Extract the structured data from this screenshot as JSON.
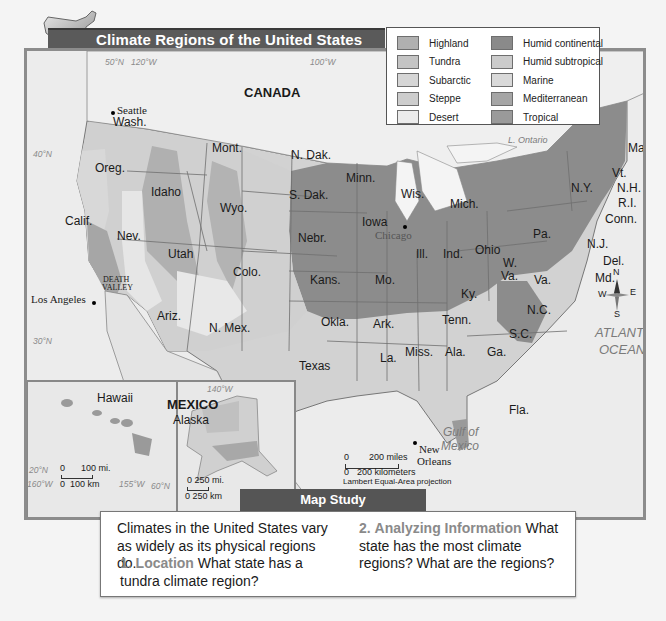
{
  "title": "Climate Regions of the United States",
  "legend": {
    "left": [
      {
        "label": "Highland",
        "color": "#b0b0b0"
      },
      {
        "label": "Tundra",
        "color": "#c4c4c4"
      },
      {
        "label": "Subarctic",
        "color": "#d6d6d6"
      },
      {
        "label": "Steppe",
        "color": "#cdcdcd"
      },
      {
        "label": "Desert",
        "color": "#ececec"
      }
    ],
    "right": [
      {
        "label": "Humid continental",
        "color": "#8a8a8a"
      },
      {
        "label": "Humid subtropical",
        "color": "#cbcbcb"
      },
      {
        "label": "Marine",
        "color": "#d9d9d9"
      },
      {
        "label": "Mediterranean",
        "color": "#a6a6a6"
      },
      {
        "label": "Tropical",
        "color": "#9a9a9a"
      }
    ]
  },
  "map": {
    "countries": {
      "canada": "CANADA",
      "mexico": "MEXICO"
    },
    "water": {
      "atlantic": "ATLANTIC",
      "ocean": "OCEAN",
      "gulf1": "Gulf of",
      "gulf2": "Mexico",
      "l_ontario": "L. Ontario",
      "l_michigan": "L. Michigan",
      "huron": "Huron",
      "erie": "L. Erie"
    },
    "coords": {
      "n50": "50°N",
      "w120": "120°W",
      "w100": "100°W",
      "n40": "40°N",
      "n30": "30°N",
      "w140": "140°W",
      "n20": "20°N",
      "w160": "160°W",
      "w155": "155°W",
      "n60": "60°N"
    },
    "cities": {
      "seattle": "Seattle",
      "los_angeles": "Los Angeles",
      "death_valley1": "DEATH",
      "death_valley2": "VALLEY",
      "chicago": "Chicago",
      "new_orleans1": "New",
      "new_orleans2": "Orleans"
    },
    "states": {
      "wash": "Wash.",
      "oreg": "Oreg.",
      "calif": "Calif.",
      "idaho": "Idaho",
      "nev": "Nev.",
      "mont": "Mont.",
      "wyo": "Wyo.",
      "utah": "Utah",
      "colo": "Colo.",
      "ariz": "Ariz.",
      "nmex": "N. Mex.",
      "ndak": "N. Dak.",
      "sdak": "S. Dak.",
      "nebr": "Nebr.",
      "kans": "Kans.",
      "okla": "Okla.",
      "texas": "Texas",
      "minn": "Minn.",
      "iowa": "Iowa",
      "mo": "Mo.",
      "ark": "Ark.",
      "la": "La.",
      "wis": "Wis.",
      "ill": "Ill.",
      "mich": "Mich.",
      "ind": "Ind.",
      "ohio": "Ohio",
      "ky": "Ky.",
      "tenn": "Tenn.",
      "miss": "Miss.",
      "ala": "Ala.",
      "ga": "Ga.",
      "fla": "Fla.",
      "wva1": "W.",
      "wva2": "Va.",
      "va": "Va.",
      "nc": "N.C.",
      "sc": "S.C.",
      "pa": "Pa.",
      "ny": "N.Y.",
      "maine": "Maine",
      "vt": "Vt.",
      "nh": "N.H.",
      "ri": "R.I.",
      "conn": "Conn.",
      "nj": "N.J.",
      "del": "Del.",
      "md": "Md.",
      "hawaii": "Hawaii",
      "alaska": "Alaska"
    },
    "compass": {
      "n": "N",
      "s": "S",
      "e": "E",
      "w": "W"
    },
    "scale": {
      "miles": "200 miles",
      "km": "200 kilometers",
      "zero": "0",
      "projection": "Lambert Equal-Area projection"
    },
    "hawaii_scale": {
      "zero": "0",
      "miles": "100 mi.",
      "km": "100 km"
    },
    "alaska_scale": {
      "miles": "0   250 mi.",
      "km": "0 250 km"
    }
  },
  "map_study": {
    "tab": "Map Study",
    "intro": "Climates in the United States vary as widely as its physical regions do.",
    "q1_num": "1.",
    "q1_head": "Location",
    "q1_text": "What state has a tundra climate region?",
    "q2_num": "2.",
    "q2_head": "Analyzing Information",
    "q2_text": "What state has the most climate regions? What are the regions?"
  }
}
